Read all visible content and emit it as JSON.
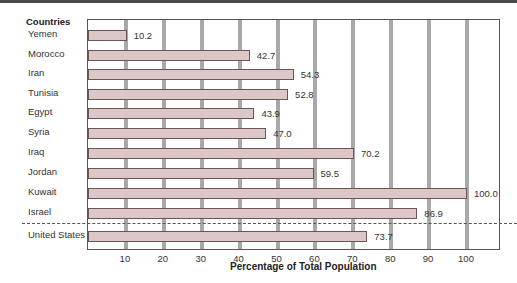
{
  "chart_data": {
    "type": "bar",
    "orientation": "horizontal",
    "title": "",
    "ylabel": "Countries",
    "xlabel": "Percentage of Total Population",
    "xlim": [
      0,
      100
    ],
    "xticks": [
      10,
      20,
      30,
      40,
      50,
      60,
      70,
      80,
      90,
      100
    ],
    "grid": true,
    "categories": [
      "Yemen",
      "Morocco",
      "Iran",
      "Tunisia",
      "Egypt",
      "Syria",
      "Iraq",
      "Jordan",
      "Kuwait",
      "Israel",
      "United States"
    ],
    "values": [
      10.2,
      42.7,
      54.3,
      52.8,
      43.9,
      47.0,
      70.2,
      59.5,
      100.0,
      86.9,
      73.7
    ],
    "value_labels": [
      "10.2",
      "42.7",
      "54.3",
      "52.8",
      "43.9",
      "47.0",
      "70.2",
      "59.5",
      "100.0",
      "86.9",
      "73.7"
    ],
    "annotations": [
      "Dashed line separates United States from Middle East countries"
    ]
  },
  "colors": {
    "bar_fill": "#dcc6c6",
    "bar_edge": "#6a5656",
    "grid": "#a9a9a9"
  }
}
